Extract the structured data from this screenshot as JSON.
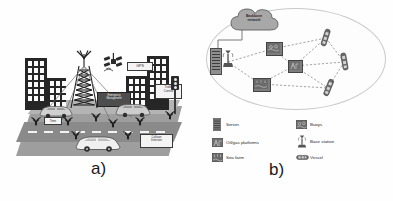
{
  "figure": {
    "panels": [
      {
        "id": "a",
        "label": "a)",
        "caption_text": "a)",
        "title": "Smart city vehicular network scenario",
        "labels": [
          {
            "name": "gps",
            "text": "GPS"
          },
          {
            "name": "traffic-control",
            "text": "Traffic\nControl"
          },
          {
            "name": "emergency-management",
            "text": "Emergency\nManagement"
          },
          {
            "name": "collision-detection",
            "text": "Collision\nDetection"
          },
          {
            "name": "time",
            "text": "Time"
          }
        ],
        "elements": {
          "buildings": "city-buildings",
          "tower": "cellular-tower",
          "satellite": "gps-satellite",
          "traffic_light": "traffic-light",
          "vehicles": "connected-vehicles",
          "signals": "wireless-signals"
        }
      },
      {
        "id": "b",
        "label": "b)",
        "caption_text": "b)",
        "title": "Maritime IoT network topology",
        "cloud": {
          "name": "backbone-network-cloud",
          "text": "Backbone\nnetwork"
        },
        "legend": {
          "left_column": [
            {
              "icon": "server-icon",
              "label": "Server"
            },
            {
              "icon": "oil-gas-platform-icon",
              "label": "Oil/gas platforms"
            },
            {
              "icon": "sea-farm-icon",
              "label": "Sea farm"
            }
          ],
          "right_column": [
            {
              "icon": "buoy-icon",
              "label": "Buoys"
            },
            {
              "icon": "base-station-icon",
              "label": "Base station"
            },
            {
              "icon": "vessel-icon",
              "label": "Vessel"
            }
          ]
        },
        "nodes": [
          {
            "name": "server",
            "type": "server"
          },
          {
            "name": "base-station",
            "type": "base-station"
          },
          {
            "name": "buoy-upper",
            "type": "buoy"
          },
          {
            "name": "buoy-middle",
            "type": "buoy"
          },
          {
            "name": "buoy-lower",
            "type": "buoy"
          },
          {
            "name": "vessel-top-right",
            "type": "vessel"
          },
          {
            "name": "vessel-right",
            "type": "vessel"
          },
          {
            "name": "vessel-bottom-right",
            "type": "vessel"
          }
        ]
      }
    ],
    "colors": {
      "ink": "#262626",
      "ground": "#9e9e9e",
      "road": "#8a8a8a",
      "plate_bg": "#f4f4f4",
      "cloud": "#a8a8a8",
      "ellipse_border": "#c9c9c9",
      "link": "#8d8d8d"
    }
  }
}
